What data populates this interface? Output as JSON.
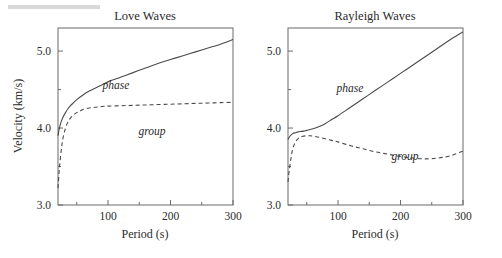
{
  "figure": {
    "y_axis_label": "Velocity (km/s)",
    "panels": [
      {
        "id": "love",
        "title": "Love Waves",
        "xlabel": "Period (s)",
        "phase_label": "phase",
        "group_label": "group"
      },
      {
        "id": "rayleigh",
        "title": "Rayleigh Waves",
        "xlabel": "Period (s)",
        "phase_label": "phase",
        "group_label": "group"
      }
    ],
    "axis": {
      "x_ticklabels": [
        "100",
        "200",
        "300"
      ],
      "x_tickvalues": [
        100,
        200,
        300
      ],
      "x_minor_tickvalues": [
        50,
        150,
        250
      ],
      "y_ticklabels": [
        "3.0",
        "4.0",
        "5.0"
      ],
      "y_tickvalues": [
        3.0,
        4.0,
        5.0
      ],
      "y_minor_tickvalues": [
        3.5,
        4.5
      ]
    },
    "colors": {
      "curve": "#4a4a4a",
      "frame": "#6b6b6b",
      "text": "#2b2b2b",
      "background": "#ffffff",
      "grey_bar": "#d9d9d9"
    }
  },
  "chart_data": [
    {
      "type": "line",
      "title": "Love Waves",
      "xlabel": "Period (s)",
      "ylabel": "Velocity (km/s)",
      "xlim": [
        20,
        300
      ],
      "ylim": [
        3.0,
        5.3
      ],
      "grid": false,
      "legend": "inline-annotations",
      "series": [
        {
          "name": "phase",
          "style": "solid",
          "x": [
            20,
            22,
            25,
            28,
            32,
            36,
            40,
            45,
            50,
            60,
            70,
            80,
            90,
            100,
            120,
            140,
            160,
            180,
            200,
            220,
            240,
            260,
            280,
            300
          ],
          "y": [
            3.9,
            3.99,
            4.08,
            4.14,
            4.2,
            4.25,
            4.29,
            4.33,
            4.37,
            4.43,
            4.48,
            4.52,
            4.56,
            4.6,
            4.66,
            4.72,
            4.78,
            4.84,
            4.89,
            4.94,
            4.99,
            5.04,
            5.09,
            5.15
          ]
        },
        {
          "name": "group",
          "style": "dashed",
          "x": [
            20,
            22,
            25,
            28,
            32,
            36,
            40,
            45,
            50,
            55,
            60,
            70,
            80,
            90,
            100,
            120,
            140,
            160,
            180,
            200,
            220,
            240,
            260,
            280,
            300
          ],
          "y": [
            3.22,
            3.45,
            3.7,
            3.87,
            4.0,
            4.08,
            4.13,
            4.17,
            4.2,
            4.22,
            4.24,
            4.26,
            4.27,
            4.28,
            4.285,
            4.29,
            4.295,
            4.3,
            4.305,
            4.31,
            4.315,
            4.32,
            4.325,
            4.33,
            4.335
          ]
        }
      ]
    },
    {
      "type": "line",
      "title": "Rayleigh Waves",
      "xlabel": "Period (s)",
      "ylabel": "Velocity (km/s)",
      "xlim": [
        20,
        300
      ],
      "ylim": [
        3.0,
        5.3
      ],
      "grid": false,
      "legend": "inline-annotations",
      "series": [
        {
          "name": "phase",
          "style": "solid",
          "x": [
            20,
            22,
            25,
            28,
            32,
            36,
            40,
            45,
            50,
            60,
            70,
            80,
            90,
            100,
            120,
            140,
            160,
            180,
            200,
            220,
            240,
            260,
            280,
            300
          ],
          "y": [
            3.85,
            3.88,
            3.91,
            3.93,
            3.94,
            3.95,
            3.955,
            3.96,
            3.97,
            3.99,
            4.02,
            4.06,
            4.11,
            4.16,
            4.27,
            4.38,
            4.49,
            4.6,
            4.71,
            4.82,
            4.93,
            5.04,
            5.15,
            5.25
          ]
        },
        {
          "name": "group",
          "style": "dashed",
          "x": [
            20,
            22,
            25,
            28,
            32,
            36,
            40,
            45,
            50,
            55,
            60,
            70,
            80,
            90,
            100,
            120,
            140,
            160,
            180,
            200,
            220,
            240,
            260,
            280,
            300
          ],
          "y": [
            3.3,
            3.45,
            3.62,
            3.74,
            3.82,
            3.86,
            3.885,
            3.895,
            3.9,
            3.9,
            3.895,
            3.88,
            3.86,
            3.84,
            3.82,
            3.77,
            3.73,
            3.69,
            3.66,
            3.63,
            3.61,
            3.6,
            3.61,
            3.64,
            3.7
          ]
        }
      ]
    }
  ]
}
